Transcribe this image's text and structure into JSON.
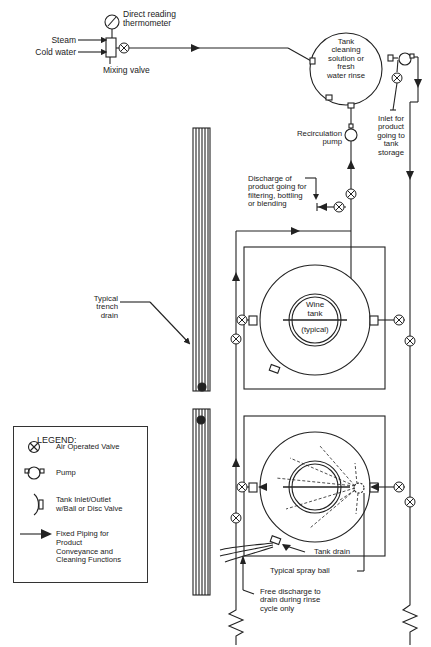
{
  "diagram": {
    "type": "process piping schematic"
  },
  "labels": {
    "thermometer": "Direct reading\nthermometer",
    "steam": "Steam",
    "cold_water": "Cold water",
    "mixing_valve": "Mixing valve",
    "cleaning_tank": "Tank\ncleaning\nsolution or\nfresh\nwater rinse",
    "inlet_product": "Inlet for\nproduct\ngoing to\ntank\nstorage",
    "recirc_pump": "Recirculation\npump",
    "discharge_product": "Discharge of\nproduct going for\nfiltering, bottling\nor blending",
    "trench_drain": "Typical\ntrench\ndrain",
    "wine_tank": "Wine\ntank",
    "wine_tank_note": "(typical)",
    "tank_drain": "Tank drain",
    "spray_ball": "Typical spray ball",
    "free_discharge": "Free discharge to\ndrain during rinse\ncycle only"
  },
  "legend": {
    "title": "LEGEND:",
    "items": [
      {
        "symbol": "air-valve-icon",
        "label": "Air Operated Valve"
      },
      {
        "symbol": "pump-icon",
        "label": "Pump"
      },
      {
        "symbol": "tank-inlet-icon",
        "label": "Tank Inlet/Outlet\nw/Ball or Disc Valve"
      },
      {
        "symbol": "flow-arrow-icon",
        "label": "Fixed Piping for\nProduct\nConveyance and\nCleaning Functions"
      }
    ]
  },
  "colors": {
    "line": "#222222",
    "background": "#ffffff"
  }
}
